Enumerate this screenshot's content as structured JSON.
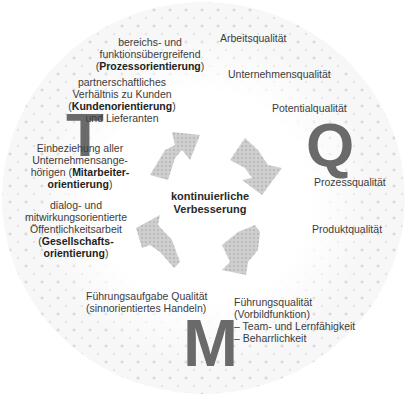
{
  "diagram": {
    "title_letters": {
      "t": "T",
      "q": "Q",
      "m": "M"
    },
    "center": {
      "line1": "kontinuierliche",
      "line2": "Verbesserung"
    },
    "left_items": [
      {
        "pre": "bereichs- und",
        "pre2": "funktionsübergreifend",
        "open": "(",
        "bold": "Prozessorientierung",
        "close": ")"
      },
      {
        "pre": "partnerschaftliches",
        "pre2": "Verhältnis zu Kunden",
        "open": "(",
        "bold": "Kundenorientierung",
        "close": ")",
        "post": "und Lieferanten"
      },
      {
        "pre": "Einbeziehung aller",
        "pre2": "Unternehmensange-",
        "pre3": "hörigen (",
        "bold": "Mitarbeiter-",
        "bold2": "orientierung",
        "close": ")"
      },
      {
        "pre": "dialog- und",
        "pre2": "mitwirkungsorientierte",
        "pre3": "Öffentlichkeitsarbeit",
        "open": "(",
        "bold": "Gesellschafts-",
        "bold2": "orientierung",
        "close": ")"
      }
    ],
    "right_items": [
      "Arbeitsqualität",
      "Unternehmensqualität",
      "Potentialqualität",
      "Prozessqualität",
      "Produktqualität"
    ],
    "bottom_left": {
      "line1": "Führungsaufgabe Qualität",
      "line2": "(sinnorientiertes Handeln)"
    },
    "bottom_right": {
      "line1": "Führungsqualität",
      "line2": "(Vorbildfunktion)",
      "line3": "– Team- und Lernfähigkeit",
      "line4": "– Beharrlichkeit"
    },
    "colors": {
      "letters": "#6a6a6a",
      "arrows": "#c4c4c4",
      "text": "#3c3c3c"
    }
  }
}
